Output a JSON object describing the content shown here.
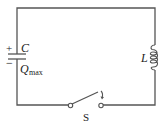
{
  "diagram": {
    "type": "LC circuit",
    "capacitor": {
      "label": "C",
      "charge_label": "Q",
      "charge_subscript": "max",
      "positive_sign": "+",
      "negative_sign": "−"
    },
    "inductor": {
      "label": "L"
    },
    "switch": {
      "label": "S",
      "state": "open"
    },
    "colors": {
      "wire": "#555555",
      "text": "#222222"
    }
  }
}
